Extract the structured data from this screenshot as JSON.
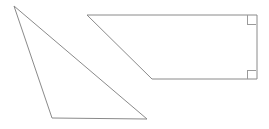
{
  "canvas": {
    "width": 269,
    "height": 129,
    "background_color": "#ffffff",
    "stroke_color": "#8a8a8a",
    "mark_color": "#9a9a9a",
    "stroke_width": 1
  },
  "figure": {
    "shape_count": 2
  },
  "shapes": [
    {
      "id": "triangle",
      "name": "scalene-triangle",
      "type": "triangle",
      "fill": "none",
      "stroke": "#8a8a8a",
      "points": "14,6 52,118 147,119",
      "vertices": [
        {
          "label": "apex",
          "x": 14,
          "y": 6
        },
        {
          "label": "bottom-left",
          "x": 52,
          "y": 118
        },
        {
          "label": "bottom-right",
          "x": 147,
          "y": 119
        }
      ],
      "right_angle_marks": []
    },
    {
      "id": "trapezoid",
      "name": "right-trapezoid",
      "type": "quadrilateral",
      "fill": "none",
      "stroke": "#8a8a8a",
      "points": "87,15 257,15 257,79 152,79",
      "vertices": [
        {
          "label": "top-left",
          "x": 87,
          "y": 15
        },
        {
          "label": "top-right",
          "x": 257,
          "y": 15
        },
        {
          "label": "bottom-right",
          "x": 257,
          "y": 79
        },
        {
          "label": "bottom-left",
          "x": 152,
          "y": 79
        }
      ],
      "right_angle_marks": [
        {
          "label": "top-right-angle",
          "x": 247,
          "y": 15,
          "size": 9,
          "orient": "down-left"
        },
        {
          "label": "bottom-right-angle",
          "x": 247,
          "y": 70,
          "size": 9,
          "orient": "up-left"
        }
      ]
    }
  ]
}
